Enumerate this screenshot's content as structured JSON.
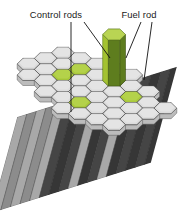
{
  "figure": {
    "kind": "nuclear-reactor-core-cutaway-diagram",
    "background_color": "#ffffff",
    "labels": [
      {
        "id": "control-rods",
        "text": "Control rods",
        "x": 56,
        "y": 18
      },
      {
        "id": "fuel-rod",
        "text": "Fuel rod",
        "x": 139,
        "y": 18
      }
    ],
    "leader_lines": [
      {
        "id": "control-rods-leader-1",
        "x1": 71,
        "y1": 22,
        "x2": 71,
        "y2": 112
      },
      {
        "id": "control-rods-leader-2",
        "x1": 84,
        "y1": 22,
        "x2": 110,
        "y2": 58
      },
      {
        "id": "fuel-rod-leader-1",
        "x1": 141,
        "y1": 22,
        "x2": 126,
        "y2": 58
      },
      {
        "id": "fuel-rod-leader-2",
        "x1": 152,
        "y1": 22,
        "x2": 144,
        "y2": 80
      }
    ],
    "colors": {
      "hex_fuel_fill": "#dcdcdc",
      "hex_fuel_fill_light": "#ebebeb",
      "hex_control_fill": "#a9c93b",
      "hex_control_fill_light": "#bdd858",
      "hex_stroke": "#4a4a4a",
      "rod_light": "#a8a8a8",
      "rod_mid": "#8c8c8c",
      "rod_dark": "#454545",
      "rod_darker": "#363636",
      "control_rod_top": "#b9d453",
      "control_rod_left": "#a3c231",
      "control_rod_right": "#5e7d1e",
      "leader_stroke": "#111111",
      "label_color": "#1a1a1a"
    },
    "geometry": {
      "hex_radius": 11.4,
      "hex_squash": 0.56,
      "origin_x": 97,
      "origin_y": 86,
      "rod_length": 96,
      "rod_skew_x": -26,
      "note": "isometric hexagonal close-packed bundle, top face tiled with hexagons, shafts extend down-left"
    },
    "hex_cells": [
      {
        "q": -2,
        "r": -2,
        "type": "fuel"
      },
      {
        "q": -1,
        "r": -2,
        "type": "fuel"
      },
      {
        "q": 0,
        "r": -2,
        "type": "fuel"
      },
      {
        "q": 1,
        "r": -2,
        "type": "fuel"
      },
      {
        "q": 2,
        "r": -2,
        "type": "fuel"
      },
      {
        "q": -3,
        "r": -1,
        "type": "fuel"
      },
      {
        "q": -2,
        "r": -1,
        "type": "fuel"
      },
      {
        "q": -1,
        "r": -1,
        "type": "control"
      },
      {
        "q": 0,
        "r": -1,
        "type": "fuel"
      },
      {
        "q": 1,
        "r": -1,
        "type": "control"
      },
      {
        "q": 2,
        "r": -1,
        "type": "fuel"
      },
      {
        "q": 3,
        "r": -1,
        "type": "fuel"
      },
      {
        "q": -4,
        "r": 0,
        "type": "fuel"
      },
      {
        "q": -3,
        "r": 0,
        "type": "fuel"
      },
      {
        "q": -2,
        "r": 0,
        "type": "control"
      },
      {
        "q": -1,
        "r": 0,
        "type": "fuel"
      },
      {
        "q": 0,
        "r": 0,
        "type": "fuel"
      },
      {
        "q": 1,
        "r": 0,
        "type": "fuel"
      },
      {
        "q": 2,
        "r": 0,
        "type": "control"
      },
      {
        "q": 3,
        "r": 0,
        "type": "fuel"
      },
      {
        "q": 4,
        "r": 0,
        "type": "fuel"
      },
      {
        "q": -4,
        "r": 1,
        "type": "fuel"
      },
      {
        "q": -3,
        "r": 1,
        "type": "fuel"
      },
      {
        "q": -2,
        "r": 1,
        "type": "fuel"
      },
      {
        "q": -1,
        "r": 1,
        "type": "fuel"
      },
      {
        "q": 0,
        "r": 1,
        "type": "fuel"
      },
      {
        "q": 1,
        "r": 1,
        "type": "fuel"
      },
      {
        "q": 2,
        "r": 1,
        "type": "fuel"
      },
      {
        "q": 3,
        "r": 1,
        "type": "fuel"
      },
      {
        "q": -3,
        "r": 2,
        "type": "fuel"
      },
      {
        "q": -2,
        "r": 2,
        "type": "fuel"
      },
      {
        "q": -1,
        "r": 2,
        "type": "control"
      },
      {
        "q": 0,
        "r": 2,
        "type": "fuel"
      },
      {
        "q": 1,
        "r": 2,
        "type": "fuel"
      },
      {
        "q": 2,
        "r": 2,
        "type": "fuel"
      },
      {
        "q": -2,
        "r": 3,
        "type": "fuel"
      },
      {
        "q": -1,
        "r": 3,
        "type": "fuel"
      },
      {
        "q": 0,
        "r": 3,
        "type": "fuel"
      },
      {
        "q": 1,
        "r": 3,
        "type": "fuel"
      }
    ],
    "raised_control_rod": {
      "id": "raised-control-rod",
      "cell": {
        "q": 1,
        "r": -1
      },
      "height": 46,
      "top_color": "#b9d453",
      "left_color": "#a3c231",
      "right_color": "#5e7d1e"
    },
    "shaft_stripes": [
      {
        "x": 0.0,
        "shade": "rod_light"
      },
      {
        "x": 0.06,
        "shade": "rod_mid"
      },
      {
        "x": 0.12,
        "shade": "rod_light"
      },
      {
        "x": 0.18,
        "shade": "rod_mid"
      },
      {
        "x": 0.24,
        "shade": "rod_light"
      },
      {
        "x": 0.3,
        "shade": "rod_dark"
      },
      {
        "x": 0.36,
        "shade": "rod_darker"
      },
      {
        "x": 0.42,
        "shade": "rod_dark"
      },
      {
        "x": 0.48,
        "shade": "rod_light"
      },
      {
        "x": 0.54,
        "shade": "rod_darker"
      },
      {
        "x": 0.6,
        "shade": "rod_dark"
      },
      {
        "x": 0.66,
        "shade": "rod_light"
      },
      {
        "x": 0.72,
        "shade": "rod_darker"
      },
      {
        "x": 0.78,
        "shade": "rod_dark"
      },
      {
        "x": 0.84,
        "shade": "rod_darker"
      },
      {
        "x": 0.9,
        "shade": "rod_dark"
      },
      {
        "x": 0.96,
        "shade": "rod_darker"
      }
    ]
  }
}
